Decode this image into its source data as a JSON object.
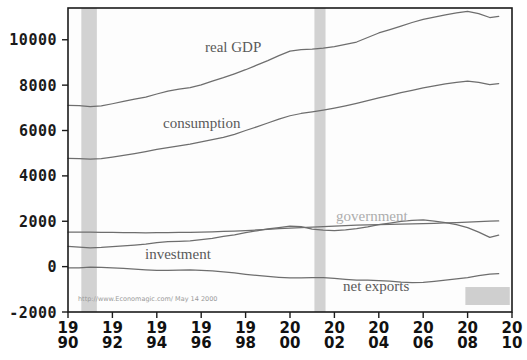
{
  "chart_data": {
    "type": "line",
    "title": "",
    "subtitle": "",
    "xlabel": "",
    "ylabel": "",
    "xlim": [
      1990,
      2010
    ],
    "ylim": [
      -2000,
      11400
    ],
    "grid": false,
    "legend_position": "inline-annotations",
    "x_tick_labels": [
      {
        "top": "19",
        "bottom": "90",
        "value": 1990
      },
      {
        "top": "19",
        "bottom": "92",
        "value": 1992
      },
      {
        "top": "19",
        "bottom": "94",
        "value": 1994
      },
      {
        "top": "19",
        "bottom": "96",
        "value": 1996
      },
      {
        "top": "19",
        "bottom": "98",
        "value": 1998
      },
      {
        "top": "20",
        "bottom": "00",
        "value": 2000
      },
      {
        "top": "20",
        "bottom": "02",
        "value": 2002
      },
      {
        "top": "20",
        "bottom": "04",
        "value": 2004
      },
      {
        "top": "20",
        "bottom": "06",
        "value": 2006
      },
      {
        "top": "20",
        "bottom": "08",
        "value": 2008
      },
      {
        "top": "20",
        "bottom": "10",
        "value": 2010
      }
    ],
    "y_tick_labels": [
      "10000",
      "8000",
      "6000",
      "4000",
      "2000",
      "0",
      "-2000"
    ],
    "y_tick_values": [
      10000,
      8000,
      6000,
      4000,
      2000,
      0,
      -2000
    ],
    "x": [
      1990,
      1990.5,
      1991,
      1991.5,
      1992,
      1992.5,
      1993,
      1993.5,
      1994,
      1994.5,
      1995,
      1995.5,
      1996,
      1996.5,
      1997,
      1997.5,
      1998,
      1998.5,
      1999,
      1999.5,
      2000,
      2000.5,
      2001,
      2001.5,
      2002,
      2002.5,
      2003,
      2003.5,
      2004,
      2004.5,
      2005,
      2005.5,
      2006,
      2006.5,
      2007,
      2007.5,
      2008,
      2008.5,
      2009,
      2009.4
    ],
    "series": [
      {
        "name": "real GDP",
        "label": "real GDP",
        "color": "#6e6e6e",
        "values": [
          7113,
          7100,
          7050,
          7090,
          7180,
          7280,
          7380,
          7470,
          7610,
          7740,
          7820,
          7890,
          8010,
          8180,
          8330,
          8500,
          8680,
          8880,
          9080,
          9300,
          9500,
          9570,
          9590,
          9630,
          9700,
          9800,
          9900,
          10100,
          10300,
          10450,
          10600,
          10760,
          10900,
          11000,
          11100,
          11180,
          11250,
          11150,
          10980,
          11030
        ]
      },
      {
        "name": "consumption",
        "label": "consumption",
        "color": "#6e6e6e",
        "values": [
          4770,
          4760,
          4740,
          4760,
          4830,
          4900,
          4980,
          5070,
          5170,
          5250,
          5320,
          5400,
          5500,
          5600,
          5700,
          5830,
          6000,
          6160,
          6330,
          6500,
          6650,
          6750,
          6820,
          6900,
          6990,
          7090,
          7200,
          7320,
          7440,
          7550,
          7670,
          7770,
          7880,
          7970,
          8060,
          8120,
          8180,
          8120,
          8020,
          8070
        ]
      },
      {
        "name": "investment",
        "label": "investment",
        "color": "#7a7a7a",
        "values": [
          895,
          860,
          830,
          845,
          880,
          910,
          950,
          990,
          1060,
          1100,
          1110,
          1130,
          1190,
          1250,
          1330,
          1400,
          1500,
          1580,
          1660,
          1720,
          1780,
          1760,
          1650,
          1610,
          1590,
          1620,
          1670,
          1750,
          1850,
          1920,
          1990,
          2040,
          2060,
          2010,
          1940,
          1850,
          1720,
          1520,
          1290,
          1390
        ]
      },
      {
        "name": "government",
        "label": "government",
        "color": "#9a9a9a",
        "values": [
          1520,
          1525,
          1520,
          1510,
          1505,
          1500,
          1495,
          1490,
          1495,
          1500,
          1505,
          1510,
          1520,
          1535,
          1550,
          1570,
          1590,
          1615,
          1645,
          1675,
          1700,
          1720,
          1740,
          1760,
          1790,
          1810,
          1830,
          1840,
          1850,
          1860,
          1870,
          1880,
          1895,
          1910,
          1925,
          1940,
          1960,
          1985,
          2005,
          2015
        ]
      },
      {
        "name": "net exports",
        "label": "net exports",
        "color": "#7a7a7a",
        "values": [
          -55,
          -50,
          -20,
          -30,
          -60,
          -80,
          -110,
          -140,
          -160,
          -170,
          -150,
          -140,
          -160,
          -190,
          -230,
          -280,
          -340,
          -390,
          -430,
          -470,
          -500,
          -500,
          -480,
          -490,
          -520,
          -560,
          -590,
          -600,
          -620,
          -640,
          -680,
          -700,
          -690,
          -650,
          -600,
          -540,
          -480,
          -400,
          -330,
          -310
        ]
      }
    ],
    "annotations": [
      {
        "name": "recession-band-1",
        "type": "vertical-band",
        "x_start": 1990.6,
        "x_end": 1991.3,
        "color": "#d2d2d2"
      },
      {
        "name": "recession-band-2",
        "type": "vertical-band",
        "x_start": 2001.1,
        "x_end": 2001.6,
        "color": "#d2d2d2"
      },
      {
        "name": "recession-band-3",
        "type": "rect-swatch",
        "x_start": 2007.9,
        "x_end": 2009.9,
        "color": "#cfcfcf"
      }
    ],
    "attribution": "http://www.Economagic.com/  May 14 2000"
  },
  "labels": {
    "real_gdp": "real GDP",
    "consumption": "consumption",
    "investment": "investment",
    "government": "government",
    "net_exports": "net exports"
  },
  "attribution": {
    "text": "http://www.Economagic.com/  May 14 2000"
  }
}
